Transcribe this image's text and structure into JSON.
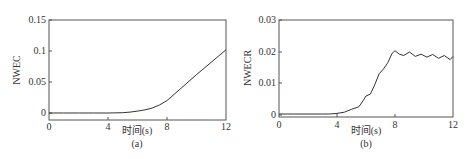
{
  "chart_data": [
    {
      "type": "line",
      "panel": "(a)",
      "title": "",
      "xlabel": "时间(s)",
      "ylabel": "NWEC",
      "caption": "(a)",
      "xlim": [
        0,
        12
      ],
      "ylim": [
        0,
        0.15
      ],
      "xticks": [
        "0",
        "4",
        "8",
        "12"
      ],
      "yticks": [
        "0",
        "0.05",
        "0.1",
        "0.15"
      ],
      "grid": false,
      "series": [
        {
          "name": "NWEC",
          "x": [
            0,
            1,
            2,
            3,
            4,
            5,
            5.5,
            6,
            6.5,
            7,
            7.5,
            8,
            9,
            10,
            11,
            12
          ],
          "y": [
            0,
            0,
            0,
            0,
            0,
            0.0005,
            0.0015,
            0.003,
            0.005,
            0.008,
            0.013,
            0.02,
            0.041,
            0.062,
            0.082,
            0.102
          ]
        }
      ]
    },
    {
      "type": "line",
      "panel": "(b)",
      "title": "",
      "xlabel": "时间(s)",
      "ylabel": "NWECR",
      "caption": "(b)",
      "xlim": [
        0,
        12
      ],
      "ylim": [
        0,
        0.03
      ],
      "xticks": [
        "0",
        "4",
        "8",
        "12"
      ],
      "yticks": [
        "0",
        "0.01",
        "0.02",
        "0.03"
      ],
      "grid": false,
      "series": [
        {
          "name": "NWECR",
          "x": [
            0,
            1,
            2,
            3,
            3.5,
            4,
            4.5,
            5,
            5.5,
            5.8,
            6,
            6.3,
            6.6,
            6.9,
            7.2,
            7.5,
            7.8,
            8,
            8.3,
            8.6,
            9,
            9.4,
            9.8,
            10.2,
            10.6,
            11,
            11.4,
            11.8,
            12
          ],
          "y": [
            0.0003,
            0.0003,
            0.0003,
            0.0003,
            0.0003,
            0.0005,
            0.0009,
            0.0018,
            0.0026,
            0.0045,
            0.006,
            0.0066,
            0.0095,
            0.013,
            0.0145,
            0.0165,
            0.0195,
            0.0203,
            0.0192,
            0.0188,
            0.0199,
            0.0185,
            0.0192,
            0.0183,
            0.0191,
            0.0179,
            0.0188,
            0.0175,
            0.0185
          ]
        }
      ]
    }
  ],
  "panels": {
    "a": {
      "ylabel": "NWEC",
      "xlabel": "时间(s)",
      "caption": "(a)",
      "yticks": [
        "0.15",
        "0.1",
        "0.05",
        "0"
      ],
      "xticks": [
        "0",
        "4",
        "8",
        "12"
      ]
    },
    "b": {
      "ylabel": "NWECR",
      "xlabel": "时间(s)",
      "caption": "(b)",
      "yticks": [
        "0.03",
        "0.02",
        "0.01",
        "0"
      ],
      "xticks": [
        "0",
        "4",
        "8",
        "12"
      ]
    }
  }
}
